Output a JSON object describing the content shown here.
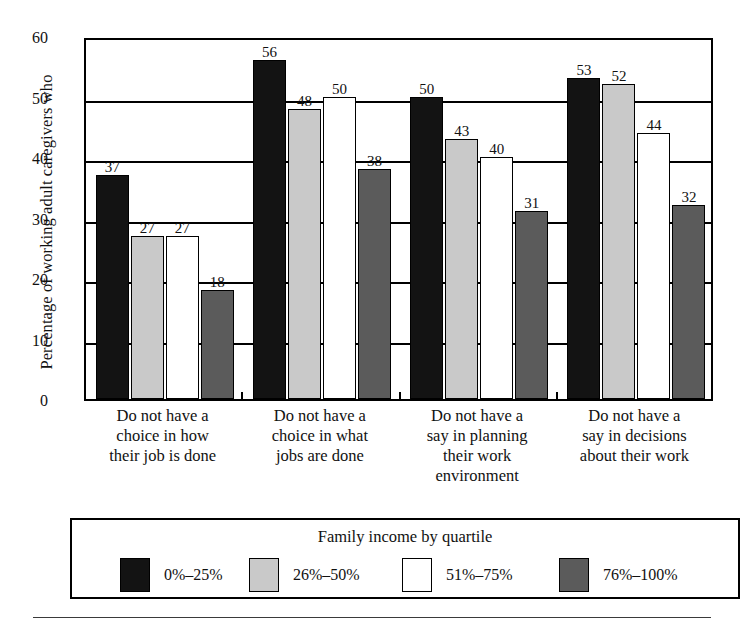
{
  "chart_data": {
    "type": "bar",
    "title": "",
    "xlabel": "",
    "ylabel": "Percentage of working adult caregivers who",
    "ylim": [
      0,
      60
    ],
    "yticks": [
      0,
      10,
      20,
      30,
      40,
      50,
      60
    ],
    "ytick_labels": [
      "0",
      "10",
      "20",
      "30",
      "40",
      "50",
      "60"
    ],
    "grid": true,
    "legend_position": "bottom",
    "legend_title": "Family income by quartile",
    "categories": [
      "Do not have a choice in how their job is done",
      "Do not have a choice in what jobs are done",
      "Do not have a say in planning their work environment",
      "Do not have a say in decisions about their work"
    ],
    "category_lines": [
      [
        "Do not have a",
        "choice in how",
        "their job is done"
      ],
      [
        "Do not have a",
        "choice in what",
        "jobs are done"
      ],
      [
        "Do not have a",
        "say in planning",
        "their work",
        "environment"
      ],
      [
        "Do not have a",
        "say in decisions",
        "about their work"
      ]
    ],
    "series": [
      {
        "name": "0%–25%",
        "color": "#131313",
        "values": [
          37,
          56,
          50,
          53
        ]
      },
      {
        "name": "26%–50%",
        "color": "#c9c9c9",
        "values": [
          27,
          48,
          43,
          52
        ]
      },
      {
        "name": "51%–75%",
        "color": "#ffffff",
        "values": [
          27,
          50,
          40,
          44
        ]
      },
      {
        "name": "76%–100%",
        "color": "#5b5b5b",
        "values": [
          18,
          38,
          31,
          32
        ]
      }
    ]
  },
  "axis": {
    "y_title": "Percentage of working adult caregivers who"
  },
  "legend": {
    "title": "Family income by quartile",
    "items": [
      {
        "label": "0%–25%",
        "color": "#131313"
      },
      {
        "label": "26%–50%",
        "color": "#c9c9c9"
      },
      {
        "label": "51%–75%",
        "color": "#ffffff"
      },
      {
        "label": "76%–100%",
        "color": "#5b5b5b"
      }
    ]
  }
}
